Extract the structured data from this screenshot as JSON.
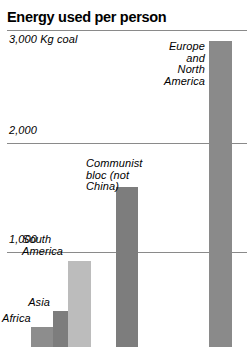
{
  "chart_data": {
    "type": "bar",
    "title": "Energy used per person",
    "xlabel": "",
    "ylabel": "Kg coal",
    "ylim": [
      0,
      3000
    ],
    "grid": true,
    "legend": false,
    "unit_note": "Kg coal",
    "categories": [
      "Africa",
      "Asia",
      "South America",
      "Communist bloc (not China)",
      "Europe and North America"
    ],
    "values": [
      320,
      460,
      920,
      1590,
      2930
    ],
    "ticks": [
      {
        "value": 3000,
        "label": "3,000 Kg coal"
      },
      {
        "value": 2000,
        "label": "2,000"
      },
      {
        "value": 1000,
        "label": "1,000"
      }
    ],
    "bars": [
      {
        "name": "africa",
        "label": "Africa",
        "value": 320,
        "color": "#8d8d8d",
        "left": 31,
        "width": 22,
        "top": 327,
        "label_left": 2,
        "label_top": 313,
        "label_width": 28,
        "label_align": "align-right"
      },
      {
        "name": "asia",
        "label": "Asia",
        "value": 460,
        "color": "#7d7d7d",
        "left": 53,
        "width": 25,
        "top": 311,
        "label_left": 22,
        "label_top": 297,
        "label_width": 28,
        "label_align": "align-right"
      },
      {
        "name": "south-america",
        "label": "South\nAmerica",
        "value": 920,
        "color": "#bcbcbc",
        "left": 68,
        "width": 23,
        "top": 261,
        "label_left": 22,
        "label_top": 234,
        "label_width": 42,
        "label_align": "align-left"
      },
      {
        "name": "communist-bloc",
        "label": "Communist\nbloc (not China)",
        "value": 1590,
        "color": "#7d7d7d",
        "left": 116,
        "width": 22,
        "top": 187,
        "label_left": 86,
        "label_top": 158,
        "label_width": 74,
        "label_align": "align-left"
      },
      {
        "name": "europe-north-america",
        "label": "Europe\nand\nNorth\nAmerica",
        "value": 2930,
        "color": "#8a8a8a",
        "left": 209,
        "width": 23,
        "top": 41,
        "label_left": 150,
        "label_top": 41,
        "label_width": 55,
        "label_align": "align-right"
      }
    ],
    "gridlines": [
      {
        "name": "gridline-3000",
        "value": 3000,
        "y": 30
      },
      {
        "name": "gridline-2000",
        "value": 2000,
        "y": 143
      },
      {
        "name": "gridline-1000",
        "value": 1000,
        "y": 252
      }
    ],
    "tick_labels": [
      {
        "name": "tick-label-3000",
        "text": "3,000 Kg coal",
        "y": 33
      },
      {
        "name": "tick-label-2000",
        "text": "2,000",
        "y": 124
      },
      {
        "name": "tick-label-1000",
        "text": "1,000",
        "y": 233
      }
    ],
    "colors": {
      "background": "#ffffff",
      "text": "#000000",
      "gridline": "#8a8a8a",
      "bar_dark": "#7d7d7d",
      "bar_mid": "#8d8d8d",
      "bar_light": "#bcbcbc"
    }
  }
}
